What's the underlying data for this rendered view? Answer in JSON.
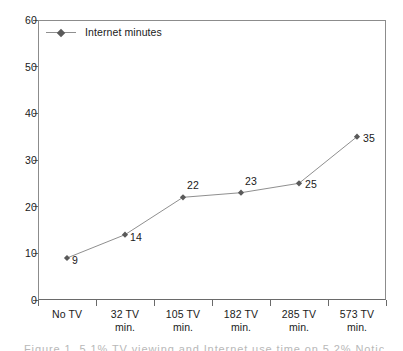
{
  "chart_data": {
    "type": "line",
    "title": "",
    "subtitle": "",
    "xlabel": "",
    "ylabel": "",
    "categories": [
      "No TV",
      "32 TV min.",
      "105 TV min.",
      "182 TV min.",
      "285 TV min.",
      "573 TV min."
    ],
    "category_lines": [
      [
        "No TV"
      ],
      [
        "32 TV",
        "min."
      ],
      [
        "105 TV",
        "min."
      ],
      [
        "182 TV",
        "min."
      ],
      [
        "285 TV",
        "min."
      ],
      [
        "573 TV",
        "min."
      ]
    ],
    "series": [
      {
        "name": "Internet minutes",
        "values": [
          9,
          14,
          22,
          23,
          25,
          35
        ],
        "marker": "diamond",
        "line_color": "#8f8f8f",
        "marker_color": "#5a5a5a"
      }
    ],
    "point_labels": [
      "9",
      "14",
      "22",
      "23",
      "25",
      "35"
    ],
    "ylim": [
      0,
      60
    ],
    "ytick_values": [
      60,
      50,
      40,
      30,
      20,
      10,
      0
    ],
    "ytick_labels": [
      "60",
      "50",
      "40",
      "30",
      "20",
      "10",
      "0"
    ],
    "ytick_step": 10,
    "grid": false,
    "legend_position": "top-left-inside",
    "legend_entries": [
      "Internet minutes"
    ]
  },
  "legend": {
    "label": "Internet minutes"
  },
  "caption": {
    "cut_off_text": "Figure 1.  5.1% TV viewing and Internet use time on 5.2% Noticed"
  },
  "colors": {
    "line": "#8f8f8f",
    "marker": "#5a5a5a",
    "frame": "#8c8c8c",
    "axis": "#6a6a6a",
    "text": "#1a1a1a",
    "background": "#ffffff"
  }
}
